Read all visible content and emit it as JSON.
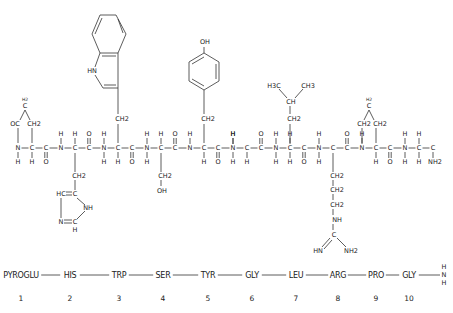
{
  "diagram": {
    "line_color": "#333333",
    "text_color": "#222222",
    "background": "#ffffff"
  },
  "backbone": {
    "atoms": [
      {
        "label": "N",
        "x": 18,
        "y": 148
      },
      {
        "label": "C",
        "x": 32,
        "y": 148
      },
      {
        "label": "C",
        "x": 46,
        "y": 148
      },
      {
        "label": "N",
        "x": 61,
        "y": 148
      },
      {
        "label": "C",
        "x": 75,
        "y": 148
      },
      {
        "label": "C",
        "x": 89,
        "y": 148
      },
      {
        "label": "N",
        "x": 104,
        "y": 148
      },
      {
        "label": "C",
        "x": 118,
        "y": 148
      },
      {
        "label": "C",
        "x": 132,
        "y": 148
      },
      {
        "label": "N",
        "x": 147,
        "y": 148
      },
      {
        "label": "C",
        "x": 161,
        "y": 148
      },
      {
        "label": "C",
        "x": 175,
        "y": 148
      },
      {
        "label": "N",
        "x": 190,
        "y": 148
      },
      {
        "label": "C",
        "x": 204,
        "y": 148
      },
      {
        "label": "C",
        "x": 218,
        "y": 148
      },
      {
        "label": "N",
        "x": 233,
        "y": 148
      },
      {
        "label": "C",
        "x": 247,
        "y": 148
      },
      {
        "label": "C",
        "x": 261,
        "y": 148
      },
      {
        "label": "N",
        "x": 276,
        "y": 148
      },
      {
        "label": "C",
        "x": 290,
        "y": 148
      },
      {
        "label": "C",
        "x": 304,
        "y": 148
      },
      {
        "label": "N",
        "x": 319,
        "y": 148
      },
      {
        "label": "C",
        "x": 333,
        "y": 148
      },
      {
        "label": "C",
        "x": 347,
        "y": 148
      },
      {
        "label": "N",
        "x": 362,
        "y": 148
      },
      {
        "label": "C",
        "x": 376,
        "y": 148
      },
      {
        "label": "C",
        "x": 390,
        "y": 148
      },
      {
        "label": "N",
        "x": 405,
        "y": 148
      },
      {
        "label": "C",
        "x": 419,
        "y": 148
      },
      {
        "label": "C",
        "x": 433,
        "y": 148
      }
    ],
    "amine_h_above": [
      61,
      104,
      147,
      190,
      233,
      276,
      319,
      405
    ],
    "amine_h_below": [
      18,
      104,
      147,
      233,
      276,
      319,
      405
    ],
    "alpha_h_above": [
      75,
      161,
      233,
      290,
      362,
      419
    ],
    "alpha_h_below": [
      32,
      118,
      204,
      247,
      290,
      376,
      419
    ],
    "carbonyl_o_above": [
      89,
      175,
      261,
      347
    ],
    "carbonyl_o_below": [
      46,
      132,
      218,
      304,
      390
    ],
    "c_terminal_amide": "NH2"
  },
  "side_chains": {
    "pyroglu": {
      "ring_top": "H2",
      "ring_top_atom": "C",
      "left": "OC",
      "right": "CH2"
    },
    "his": {
      "linker": "CH2",
      "ring": [
        "HC",
        "C",
        "NH",
        "C",
        "N"
      ],
      "ring_h": "H"
    },
    "trp": {
      "linker": "CH2",
      "nh": "HN"
    },
    "ser": {
      "linker": "CH2",
      "terminal": "OH"
    },
    "tyr": {
      "linker": "CH2",
      "terminal": "OH"
    },
    "leu": {
      "linker": "CH2",
      "branch": "CH",
      "methyl_left": "H3C",
      "methyl_right": "CH3"
    },
    "arg": {
      "chain": [
        "CH2",
        "CH2",
        "CH2"
      ],
      "nh": "NH",
      "center": "C",
      "imine": "HN",
      "amine": "NH2"
    },
    "pro": {
      "ring_top": "H2",
      "ring_top_atom": "C",
      "left": "CH2",
      "right": "CH2"
    }
  },
  "sequence": {
    "residues": [
      {
        "name": "PYROGLU",
        "number": "1",
        "x": 21
      },
      {
        "name": "HIS",
        "number": "2",
        "x": 70
      },
      {
        "name": "TRP",
        "number": "3",
        "x": 119
      },
      {
        "name": "SER",
        "number": "4",
        "x": 163
      },
      {
        "name": "TYR",
        "number": "5",
        "x": 208
      },
      {
        "name": "GLY",
        "number": "6",
        "x": 252
      },
      {
        "name": "LEU",
        "number": "7",
        "x": 296
      },
      {
        "name": "ARG",
        "number": "8",
        "x": 338
      },
      {
        "name": "PRO",
        "number": "9",
        "x": 376
      },
      {
        "name": "GLY",
        "number": "10",
        "x": 409
      }
    ],
    "terminal": {
      "top": "H",
      "middle": "N",
      "bottom": "H"
    },
    "label_y": 275,
    "number_y": 298
  }
}
